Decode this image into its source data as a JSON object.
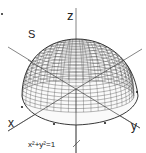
{
  "diagram": {
    "type": "hemisphere surface",
    "labels": {
      "z_axis": "z",
      "x_axis": "x",
      "y_axis": "y",
      "surface": "S",
      "boundary_equation": "x²+y²=1"
    },
    "colors": {
      "mesh": "#333333",
      "axes": "#555555",
      "background": "#ffffff"
    }
  }
}
